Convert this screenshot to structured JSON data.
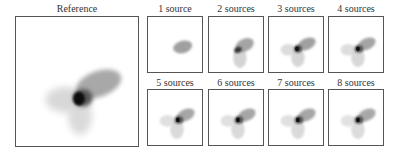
{
  "figure": {
    "reference": {
      "title": "Reference"
    },
    "panels": [
      {
        "title": "1 source",
        "sources": 1
      },
      {
        "title": "2 sources",
        "sources": 2
      },
      {
        "title": "3 sources",
        "sources": 3
      },
      {
        "title": "4 sources",
        "sources": 4
      },
      {
        "title": "5 sources",
        "sources": 5
      },
      {
        "title": "6 sources",
        "sources": 6
      },
      {
        "title": "7 sources",
        "sources": 7
      },
      {
        "title": "8 sources",
        "sources": 8
      }
    ]
  }
}
